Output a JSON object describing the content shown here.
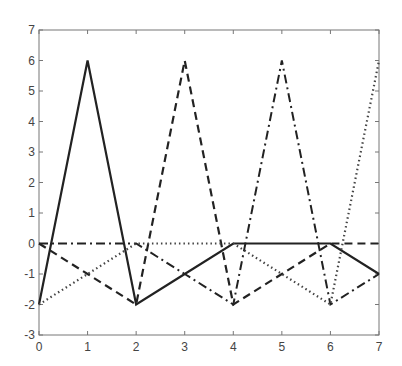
{
  "chart_data": {
    "type": "line",
    "title": "",
    "xlabel": "",
    "ylabel": "",
    "xlim": [
      0,
      7
    ],
    "ylim": [
      -3,
      7
    ],
    "grid": false,
    "legend": null,
    "x": [
      0,
      1,
      2,
      3,
      4,
      5,
      6,
      7
    ],
    "xticks": [
      0,
      1,
      2,
      3,
      4,
      5,
      6,
      7
    ],
    "yticks": [
      -3,
      -2,
      -1,
      0,
      1,
      2,
      3,
      4,
      5,
      6,
      7
    ],
    "series": [
      {
        "name": "solid",
        "style": "solid",
        "color": "#222222",
        "values": [
          -2,
          6,
          -2,
          -1,
          0,
          0,
          0,
          -1
        ]
      },
      {
        "name": "dashed",
        "style": "dashed",
        "color": "#222222",
        "values": [
          0,
          -1,
          -2,
          6,
          -2,
          -1,
          0,
          0
        ]
      },
      {
        "name": "dash-dot",
        "style": "dashdot",
        "color": "#222222",
        "values": [
          0,
          0,
          0,
          -1,
          -2,
          6,
          -2,
          -1
        ]
      },
      {
        "name": "dotted",
        "style": "dotted",
        "color": "#444444",
        "values": [
          -2,
          -1,
          0,
          0,
          0,
          -1,
          -2,
          6
        ]
      }
    ]
  }
}
